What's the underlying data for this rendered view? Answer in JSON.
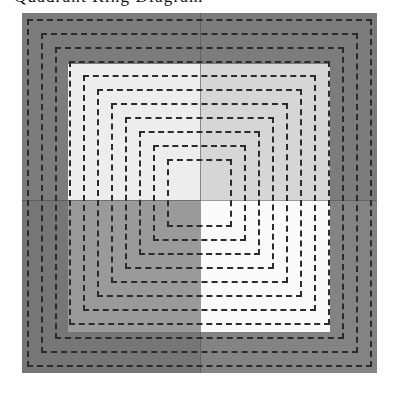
{
  "caption": {
    "text": "Quadrant Ring Diagram"
  },
  "figure": {
    "canvas": {
      "x": 22,
      "y": 13,
      "width": 355,
      "height": 360
    },
    "background_color": "#7c7c7c",
    "quadrant_center": {
      "x": 178,
      "y": 187
    },
    "quadrants": [
      {
        "name": "top-left",
        "color": "#ededed"
      },
      {
        "name": "top-right",
        "color": "#d6d6d6"
      },
      {
        "name": "bottom-left",
        "color": "#9a9a9a"
      },
      {
        "name": "bottom-right",
        "color": "#fafafa"
      }
    ],
    "inner_panel": {
      "x": 46,
      "y": 51,
      "width": 262,
      "height": 268
    },
    "dash": {
      "color": "#2b2b2b",
      "width": 2,
      "dash_length": 6,
      "gap_length": 4
    },
    "ring_count": 11,
    "rings": [
      {
        "index": 1,
        "x": 5,
        "y": 6,
        "width": 345,
        "height": 348
      },
      {
        "index": 2,
        "x": 19,
        "y": 20,
        "width": 317,
        "height": 320
      },
      {
        "index": 3,
        "x": 33,
        "y": 34,
        "width": 289,
        "height": 292
      },
      {
        "index": 4,
        "x": 47,
        "y": 48,
        "width": 261,
        "height": 264
      },
      {
        "index": 5,
        "x": 61,
        "y": 62,
        "width": 233,
        "height": 236
      },
      {
        "index": 6,
        "x": 75,
        "y": 76,
        "width": 205,
        "height": 208
      },
      {
        "index": 7,
        "x": 89,
        "y": 90,
        "width": 177,
        "height": 180
      },
      {
        "index": 8,
        "x": 103,
        "y": 104,
        "width": 149,
        "height": 152
      },
      {
        "index": 9,
        "x": 117,
        "y": 118,
        "width": 121,
        "height": 124
      },
      {
        "index": 10,
        "x": 131,
        "y": 132,
        "width": 93,
        "height": 96
      },
      {
        "index": 11,
        "x": 145,
        "y": 146,
        "width": 65,
        "height": 68
      }
    ]
  }
}
